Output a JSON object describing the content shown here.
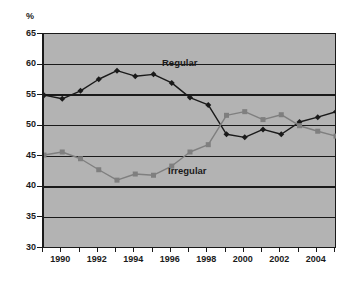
{
  "axis": {
    "unit_label": "%",
    "y_ticks": [
      65,
      60,
      55,
      50,
      45,
      40,
      35,
      30
    ],
    "x_ticks_all": [
      1989,
      1990,
      1991,
      1992,
      1993,
      1994,
      1995,
      1996,
      1997,
      1998,
      1999,
      2000,
      2001,
      2002,
      2003,
      2004,
      2005
    ],
    "x_ticks_labeled": [
      1990,
      1992,
      1994,
      1996,
      1998,
      2000,
      2002,
      2004
    ]
  },
  "labels": {
    "regular": "Regular",
    "irregular": "Irregular"
  },
  "colors": {
    "plot_background": "#b3b3b3",
    "gridline": "#1a1a1a",
    "axis": "#1a1a1a",
    "regular_series": "#1a1a1a",
    "irregular_series": "#7f7f7f",
    "page_background": "#ffffff",
    "text": "#1a1a1a"
  },
  "chart_data": {
    "type": "line",
    "title": "",
    "subtitle": "",
    "xlabel": "",
    "ylabel": "%",
    "ylim": [
      30,
      65
    ],
    "xlim": [
      1989,
      2005
    ],
    "ytick_step": 5,
    "grid": true,
    "grid_axis": "y",
    "legend_position": "inline-annotation",
    "x": [
      1989,
      1990,
      1991,
      1992,
      1993,
      1994,
      1995,
      1996,
      1997,
      1998,
      1999,
      2000,
      2001,
      2002,
      2003,
      2004,
      2005
    ],
    "series": [
      {
        "name": "Regular",
        "marker": "diamond",
        "color": "#1a1a1a",
        "values": [
          55.0,
          54.4,
          55.7,
          57.6,
          59.0,
          58.1,
          58.4,
          57.0,
          54.6,
          53.4,
          48.6,
          48.1,
          49.4,
          48.6,
          50.6,
          51.4,
          52.3
        ]
      },
      {
        "name": "Irregular",
        "marker": "square",
        "color": "#7f7f7f",
        "values": [
          45.2,
          45.7,
          44.6,
          42.8,
          41.1,
          42.1,
          41.9,
          43.4,
          45.7,
          46.9,
          51.7,
          52.3,
          51.0,
          51.8,
          50.0,
          49.1,
          48.3
        ]
      }
    ],
    "annotations": [
      {
        "text": "Regular",
        "x": 1995.8,
        "y": 59.0
      },
      {
        "text": "Irregular",
        "x": 1996.2,
        "y": 43.5
      }
    ]
  }
}
